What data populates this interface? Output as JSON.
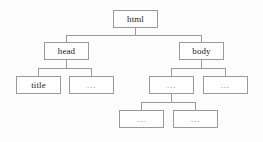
{
  "diagram": {
    "type": "dom-tree",
    "border_color": "#9a9a9a",
    "node_fill": "#ffffff",
    "background": "#fdfdfd",
    "text_color": "#1d1d1d",
    "ellipsis_color": "#6d6d6d",
    "levels": 4,
    "nodes": [
      {
        "id": "html",
        "label": "html",
        "level": 0,
        "x": 113,
        "y": 10,
        "w": 45,
        "h": 18,
        "kind": "element"
      },
      {
        "id": "head",
        "label": "head",
        "level": 1,
        "x": 44,
        "y": 42,
        "w": 45,
        "h": 18,
        "kind": "element"
      },
      {
        "id": "body",
        "label": "body",
        "level": 1,
        "x": 179,
        "y": 42,
        "w": 45,
        "h": 18,
        "kind": "element"
      },
      {
        "id": "title",
        "label": "title",
        "level": 2,
        "x": 16,
        "y": 76,
        "w": 45,
        "h": 18,
        "kind": "element"
      },
      {
        "id": "head-2",
        "label": "…",
        "level": 2,
        "x": 69,
        "y": 76,
        "w": 45,
        "h": 18,
        "kind": "ellipsis"
      },
      {
        "id": "body-1",
        "label": "…",
        "level": 2,
        "x": 149,
        "y": 76,
        "w": 45,
        "h": 18,
        "kind": "ellipsis"
      },
      {
        "id": "body-2",
        "label": "…",
        "level": 2,
        "x": 203,
        "y": 76,
        "w": 45,
        "h": 18,
        "kind": "ellipsis"
      },
      {
        "id": "leaf-1",
        "label": "…",
        "level": 3,
        "x": 119,
        "y": 110,
        "w": 45,
        "h": 18,
        "kind": "ellipsis"
      },
      {
        "id": "leaf-2",
        "label": "…",
        "level": 3,
        "x": 173,
        "y": 110,
        "w": 45,
        "h": 18,
        "kind": "ellipsis"
      }
    ],
    "edges": [
      {
        "from": "html",
        "to": "head",
        "bus_y": 35
      },
      {
        "from": "html",
        "to": "body",
        "bus_y": 35
      },
      {
        "from": "head",
        "to": "title",
        "bus_y": 68
      },
      {
        "from": "head",
        "to": "head-2",
        "bus_y": 68
      },
      {
        "from": "body",
        "to": "body-1",
        "bus_y": 68
      },
      {
        "from": "body",
        "to": "body-2",
        "bus_y": 68
      },
      {
        "from": "body-1",
        "to": "leaf-1",
        "bus_y": 102
      },
      {
        "from": "body-1",
        "to": "leaf-2",
        "bus_y": 102
      }
    ]
  }
}
